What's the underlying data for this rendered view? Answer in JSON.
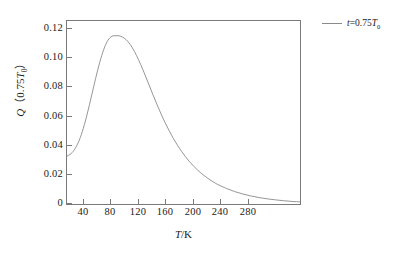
{
  "chart_data": {
    "type": "line",
    "title": "",
    "xlabel": "T/K",
    "ylabel": "Q (0.75T0)",
    "xlabel_parts": {
      "symbol": "T",
      "unit": "/K"
    },
    "ylabel_parts": {
      "symbol": "Q",
      "open_paren": "（",
      "value": "0.75",
      "sub_symbol": "T",
      "subscript": "0",
      "close_paren": "）"
    },
    "xlim": [
      15,
      300
    ],
    "ylim": [
      0,
      0.128
    ],
    "xticks": [
      40,
      80,
      120,
      160,
      200,
      240,
      280
    ],
    "xticklabels": [
      "40",
      "80",
      "120",
      "160",
      "200",
      "240",
      "280"
    ],
    "yticks": [
      0,
      0.02,
      0.04,
      0.06,
      0.08,
      0.1,
      0.12
    ],
    "yticklabels": [
      "0",
      "0.02",
      "0.04",
      "0.06",
      "0.08",
      "0.10",
      "0.12"
    ],
    "grid": false,
    "legend_position": "outside-top-right",
    "line_color": "#8a8a8a",
    "axis_color": "#7a7a7a",
    "series": [
      {
        "name": "t=0.75T0",
        "legend_label_parts": {
          "symbol": "t",
          "equals": "=",
          "value": "0.75",
          "sub_symbol": "T",
          "subscript": "0"
        },
        "color": "#8a8a8a",
        "x": [
          15,
          20,
          25,
          30,
          35,
          40,
          45,
          50,
          55,
          60,
          65,
          70,
          75,
          80,
          85,
          90,
          95,
          100,
          105,
          110,
          115,
          120,
          125,
          130,
          135,
          140,
          145,
          150,
          155,
          160,
          165,
          170,
          175,
          180,
          185,
          190,
          195,
          200,
          210,
          220,
          230,
          240,
          250,
          260,
          270,
          280,
          290,
          300
        ],
        "y": [
          0.0335,
          0.0352,
          0.0388,
          0.0446,
          0.053,
          0.0636,
          0.0756,
          0.0878,
          0.099,
          0.1082,
          0.1145,
          0.1173,
          0.1177,
          0.1175,
          0.116,
          0.1133,
          0.1092,
          0.1039,
          0.0977,
          0.0909,
          0.0838,
          0.0766,
          0.0697,
          0.0631,
          0.0569,
          0.0512,
          0.046,
          0.0412,
          0.0369,
          0.033,
          0.0295,
          0.0264,
          0.0236,
          0.0211,
          0.0189,
          0.0169,
          0.0151,
          0.0135,
          0.0109,
          0.0087,
          0.007,
          0.0056,
          0.0045,
          0.0036,
          0.0029,
          0.0023,
          0.0018,
          0.0015
        ]
      }
    ],
    "peak": {
      "x": 78,
      "y": 0.1177
    },
    "start_value": {
      "x": 15,
      "y": 0.0335
    }
  }
}
